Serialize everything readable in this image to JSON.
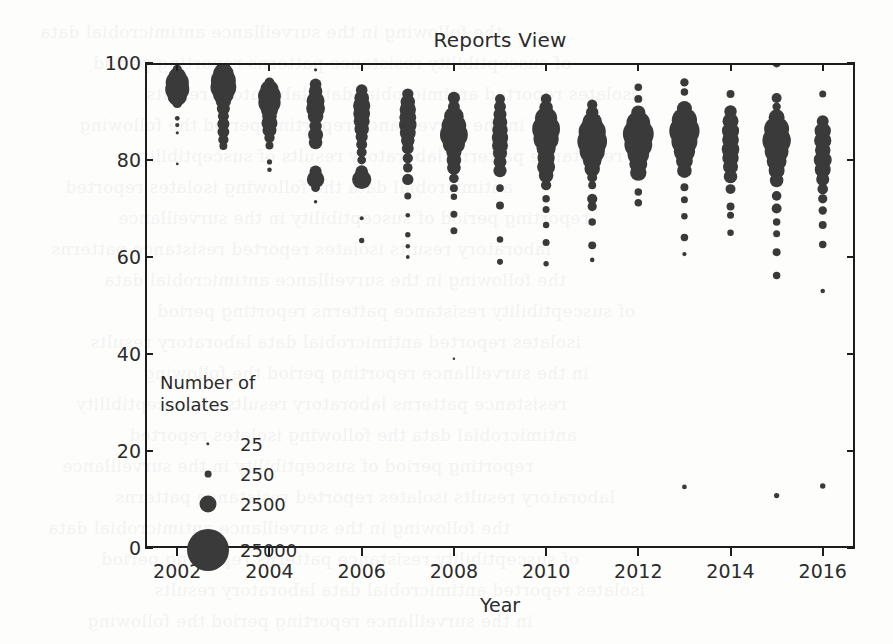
{
  "chart_data": {
    "type": "scatter",
    "title": "Reports View",
    "xlabel": "Year",
    "ylabel": "Susceptibility Percent",
    "xlim": [
      2001.3,
      2016.7
    ],
    "ylim": [
      0,
      100
    ],
    "xticks": [
      2002,
      2004,
      2006,
      2008,
      2010,
      2012,
      2014,
      2016
    ],
    "yticks": [
      0,
      20,
      40,
      60,
      80,
      100
    ],
    "grid": false,
    "size_encoding": "marker area proportional to number of isolates",
    "legend": {
      "title": "Number of\nisolates",
      "position": "lower-left inside axes",
      "entries": [
        {
          "label": "25",
          "value": 25,
          "radius_px": 1.7
        },
        {
          "label": "250",
          "value": 250,
          "radius_px": 3.4
        },
        {
          "label": "2500",
          "value": 2500,
          "radius_px": 8.5
        },
        {
          "label": "25000",
          "value": 25000,
          "radius_px": 21.0
        }
      ]
    },
    "points": [
      {
        "x": 2002,
        "y": 98.7,
        "n": 1200
      },
      {
        "x": 2002,
        "y": 97.3,
        "n": 4200
      },
      {
        "x": 2002,
        "y": 96.0,
        "n": 7600
      },
      {
        "x": 2002,
        "y": 94.6,
        "n": 8200
      },
      {
        "x": 2002,
        "y": 93.2,
        "n": 5400
      },
      {
        "x": 2002,
        "y": 91.8,
        "n": 1500
      },
      {
        "x": 2002,
        "y": 88.6,
        "n": 320
      },
      {
        "x": 2002,
        "y": 87.2,
        "n": 260
      },
      {
        "x": 2002,
        "y": 85.6,
        "n": 140
      },
      {
        "x": 2002,
        "y": 79.2,
        "n": 110
      },
      {
        "x": 2003,
        "y": 99.2,
        "n": 2600
      },
      {
        "x": 2003,
        "y": 97.8,
        "n": 6000
      },
      {
        "x": 2003,
        "y": 96.4,
        "n": 8800
      },
      {
        "x": 2003,
        "y": 95.0,
        "n": 9400
      },
      {
        "x": 2003,
        "y": 93.6,
        "n": 6200
      },
      {
        "x": 2003,
        "y": 92.2,
        "n": 3400
      },
      {
        "x": 2003,
        "y": 90.6,
        "n": 2400
      },
      {
        "x": 2003,
        "y": 89.0,
        "n": 1700
      },
      {
        "x": 2003,
        "y": 87.4,
        "n": 2100
      },
      {
        "x": 2003,
        "y": 85.8,
        "n": 2000
      },
      {
        "x": 2003,
        "y": 84.2,
        "n": 1500
      },
      {
        "x": 2003,
        "y": 82.9,
        "n": 900
      },
      {
        "x": 2004,
        "y": 96.0,
        "n": 1400
      },
      {
        "x": 2004,
        "y": 94.6,
        "n": 4600
      },
      {
        "x": 2004,
        "y": 93.2,
        "n": 7400
      },
      {
        "x": 2004,
        "y": 91.8,
        "n": 7000
      },
      {
        "x": 2004,
        "y": 90.4,
        "n": 4200
      },
      {
        "x": 2004,
        "y": 89.0,
        "n": 3000
      },
      {
        "x": 2004,
        "y": 87.6,
        "n": 3600
      },
      {
        "x": 2004,
        "y": 86.2,
        "n": 2800
      },
      {
        "x": 2004,
        "y": 84.6,
        "n": 1500
      },
      {
        "x": 2004,
        "y": 83.0,
        "n": 900
      },
      {
        "x": 2004,
        "y": 79.6,
        "n": 380
      },
      {
        "x": 2004,
        "y": 78.0,
        "n": 300
      },
      {
        "x": 2005,
        "y": 98.6,
        "n": 150
      },
      {
        "x": 2005,
        "y": 95.6,
        "n": 1900
      },
      {
        "x": 2005,
        "y": 94.2,
        "n": 2600
      },
      {
        "x": 2005,
        "y": 92.2,
        "n": 4600
      },
      {
        "x": 2005,
        "y": 90.6,
        "n": 5000
      },
      {
        "x": 2005,
        "y": 89.0,
        "n": 3400
      },
      {
        "x": 2005,
        "y": 87.0,
        "n": 2200
      },
      {
        "x": 2005,
        "y": 85.2,
        "n": 3200
      },
      {
        "x": 2005,
        "y": 83.6,
        "n": 2600
      },
      {
        "x": 2005,
        "y": 77.6,
        "n": 2100
      },
      {
        "x": 2005,
        "y": 76.0,
        "n": 4300
      },
      {
        "x": 2005,
        "y": 74.3,
        "n": 1100
      },
      {
        "x": 2005,
        "y": 71.4,
        "n": 180
      },
      {
        "x": 2006,
        "y": 94.4,
        "n": 1900
      },
      {
        "x": 2006,
        "y": 92.8,
        "n": 3100
      },
      {
        "x": 2006,
        "y": 91.2,
        "n": 4200
      },
      {
        "x": 2006,
        "y": 89.6,
        "n": 4000
      },
      {
        "x": 2006,
        "y": 88.0,
        "n": 3600
      },
      {
        "x": 2006,
        "y": 86.4,
        "n": 3000
      },
      {
        "x": 2006,
        "y": 84.8,
        "n": 2100
      },
      {
        "x": 2006,
        "y": 83.2,
        "n": 1700
      },
      {
        "x": 2006,
        "y": 81.6,
        "n": 1400
      },
      {
        "x": 2006,
        "y": 80.0,
        "n": 1100
      },
      {
        "x": 2006,
        "y": 77.6,
        "n": 2300
      },
      {
        "x": 2006,
        "y": 76.0,
        "n": 5200
      },
      {
        "x": 2006,
        "y": 68.0,
        "n": 230
      },
      {
        "x": 2006,
        "y": 63.4,
        "n": 400
      },
      {
        "x": 2007,
        "y": 93.6,
        "n": 1800
      },
      {
        "x": 2007,
        "y": 92.0,
        "n": 3000
      },
      {
        "x": 2007,
        "y": 90.4,
        "n": 3800
      },
      {
        "x": 2007,
        "y": 88.8,
        "n": 4000
      },
      {
        "x": 2007,
        "y": 87.2,
        "n": 4400
      },
      {
        "x": 2007,
        "y": 85.6,
        "n": 3600
      },
      {
        "x": 2007,
        "y": 84.0,
        "n": 2600
      },
      {
        "x": 2007,
        "y": 82.4,
        "n": 2000
      },
      {
        "x": 2007,
        "y": 80.4,
        "n": 1500
      },
      {
        "x": 2007,
        "y": 78.4,
        "n": 1300
      },
      {
        "x": 2007,
        "y": 76.0,
        "n": 1800
      },
      {
        "x": 2007,
        "y": 72.6,
        "n": 700
      },
      {
        "x": 2007,
        "y": 68.6,
        "n": 300
      },
      {
        "x": 2007,
        "y": 64.6,
        "n": 420
      },
      {
        "x": 2007,
        "y": 62.2,
        "n": 280
      },
      {
        "x": 2007,
        "y": 60.0,
        "n": 200
      },
      {
        "x": 2008,
        "y": 92.8,
        "n": 2100
      },
      {
        "x": 2008,
        "y": 91.0,
        "n": 2000
      },
      {
        "x": 2008,
        "y": 89.0,
        "n": 5400
      },
      {
        "x": 2008,
        "y": 87.0,
        "n": 8600
      },
      {
        "x": 2008,
        "y": 85.2,
        "n": 11000
      },
      {
        "x": 2008,
        "y": 83.4,
        "n": 7000
      },
      {
        "x": 2008,
        "y": 81.6,
        "n": 3200
      },
      {
        "x": 2008,
        "y": 80.0,
        "n": 3000
      },
      {
        "x": 2008,
        "y": 78.4,
        "n": 2700
      },
      {
        "x": 2008,
        "y": 76.2,
        "n": 1300
      },
      {
        "x": 2008,
        "y": 74.2,
        "n": 900
      },
      {
        "x": 2008,
        "y": 72.4,
        "n": 600
      },
      {
        "x": 2008,
        "y": 68.8,
        "n": 700
      },
      {
        "x": 2008,
        "y": 65.4,
        "n": 700
      },
      {
        "x": 2008,
        "y": 39.0,
        "n": 90
      },
      {
        "x": 2009,
        "y": 92.6,
        "n": 1400
      },
      {
        "x": 2009,
        "y": 91.0,
        "n": 2000
      },
      {
        "x": 2009,
        "y": 89.4,
        "n": 2400
      },
      {
        "x": 2009,
        "y": 87.8,
        "n": 3000
      },
      {
        "x": 2009,
        "y": 86.2,
        "n": 3400
      },
      {
        "x": 2009,
        "y": 84.6,
        "n": 3800
      },
      {
        "x": 2009,
        "y": 83.0,
        "n": 3600
      },
      {
        "x": 2009,
        "y": 81.4,
        "n": 2800
      },
      {
        "x": 2009,
        "y": 79.6,
        "n": 2400
      },
      {
        "x": 2009,
        "y": 77.8,
        "n": 2500
      },
      {
        "x": 2009,
        "y": 74.2,
        "n": 800
      },
      {
        "x": 2009,
        "y": 70.6,
        "n": 900
      },
      {
        "x": 2009,
        "y": 63.6,
        "n": 600
      },
      {
        "x": 2009,
        "y": 59.0,
        "n": 520
      },
      {
        "x": 2010,
        "y": 92.6,
        "n": 1600
      },
      {
        "x": 2010,
        "y": 90.8,
        "n": 2600
      },
      {
        "x": 2010,
        "y": 88.6,
        "n": 7000
      },
      {
        "x": 2010,
        "y": 86.4,
        "n": 11000
      },
      {
        "x": 2010,
        "y": 84.4,
        "n": 9000
      },
      {
        "x": 2010,
        "y": 82.4,
        "n": 5200
      },
      {
        "x": 2010,
        "y": 80.4,
        "n": 4200
      },
      {
        "x": 2010,
        "y": 78.6,
        "n": 4600
      },
      {
        "x": 2010,
        "y": 76.8,
        "n": 3000
      },
      {
        "x": 2010,
        "y": 74.8,
        "n": 1500
      },
      {
        "x": 2010,
        "y": 72.0,
        "n": 800
      },
      {
        "x": 2010,
        "y": 69.8,
        "n": 700
      },
      {
        "x": 2010,
        "y": 66.6,
        "n": 600
      },
      {
        "x": 2010,
        "y": 63.0,
        "n": 700
      },
      {
        "x": 2010,
        "y": 58.6,
        "n": 420
      },
      {
        "x": 2011,
        "y": 91.4,
        "n": 1500
      },
      {
        "x": 2011,
        "y": 89.8,
        "n": 2200
      },
      {
        "x": 2011,
        "y": 87.8,
        "n": 5600
      },
      {
        "x": 2011,
        "y": 85.8,
        "n": 10500
      },
      {
        "x": 2011,
        "y": 83.8,
        "n": 12500
      },
      {
        "x": 2011,
        "y": 81.8,
        "n": 9000
      },
      {
        "x": 2011,
        "y": 80.0,
        "n": 5000
      },
      {
        "x": 2011,
        "y": 78.2,
        "n": 3400
      },
      {
        "x": 2011,
        "y": 76.4,
        "n": 1400
      },
      {
        "x": 2011,
        "y": 74.8,
        "n": 900
      },
      {
        "x": 2011,
        "y": 72.0,
        "n": 1500
      },
      {
        "x": 2011,
        "y": 70.4,
        "n": 1200
      },
      {
        "x": 2011,
        "y": 67.2,
        "n": 800
      },
      {
        "x": 2011,
        "y": 62.4,
        "n": 900
      },
      {
        "x": 2011,
        "y": 59.4,
        "n": 300
      },
      {
        "x": 2012,
        "y": 95.0,
        "n": 800
      },
      {
        "x": 2012,
        "y": 92.6,
        "n": 900
      },
      {
        "x": 2012,
        "y": 89.8,
        "n": 2800
      },
      {
        "x": 2012,
        "y": 87.6,
        "n": 8000
      },
      {
        "x": 2012,
        "y": 85.4,
        "n": 13500
      },
      {
        "x": 2012,
        "y": 83.2,
        "n": 11000
      },
      {
        "x": 2012,
        "y": 81.2,
        "n": 6600
      },
      {
        "x": 2012,
        "y": 79.2,
        "n": 4600
      },
      {
        "x": 2012,
        "y": 77.4,
        "n": 3800
      },
      {
        "x": 2012,
        "y": 73.4,
        "n": 800
      },
      {
        "x": 2012,
        "y": 71.2,
        "n": 800
      },
      {
        "x": 2013,
        "y": 96.0,
        "n": 1000
      },
      {
        "x": 2013,
        "y": 94.0,
        "n": 800
      },
      {
        "x": 2013,
        "y": 90.6,
        "n": 3200
      },
      {
        "x": 2013,
        "y": 88.2,
        "n": 9000
      },
      {
        "x": 2013,
        "y": 86.0,
        "n": 13000
      },
      {
        "x": 2013,
        "y": 83.8,
        "n": 9600
      },
      {
        "x": 2013,
        "y": 81.8,
        "n": 6400
      },
      {
        "x": 2013,
        "y": 79.8,
        "n": 4000
      },
      {
        "x": 2013,
        "y": 77.8,
        "n": 3000
      },
      {
        "x": 2013,
        "y": 74.4,
        "n": 900
      },
      {
        "x": 2013,
        "y": 71.8,
        "n": 700
      },
      {
        "x": 2013,
        "y": 68.4,
        "n": 600
      },
      {
        "x": 2013,
        "y": 64.0,
        "n": 800
      },
      {
        "x": 2013,
        "y": 60.6,
        "n": 260
      },
      {
        "x": 2013,
        "y": 12.6,
        "n": 330
      },
      {
        "x": 2014,
        "y": 93.6,
        "n": 900
      },
      {
        "x": 2014,
        "y": 90.0,
        "n": 2200
      },
      {
        "x": 2014,
        "y": 88.0,
        "n": 3600
      },
      {
        "x": 2014,
        "y": 86.0,
        "n": 4200
      },
      {
        "x": 2014,
        "y": 84.2,
        "n": 4000
      },
      {
        "x": 2014,
        "y": 82.2,
        "n": 4400
      },
      {
        "x": 2014,
        "y": 80.4,
        "n": 3800
      },
      {
        "x": 2014,
        "y": 78.6,
        "n": 3200
      },
      {
        "x": 2014,
        "y": 76.6,
        "n": 2600
      },
      {
        "x": 2014,
        "y": 74.0,
        "n": 1400
      },
      {
        "x": 2014,
        "y": 70.4,
        "n": 900
      },
      {
        "x": 2014,
        "y": 68.6,
        "n": 700
      },
      {
        "x": 2014,
        "y": 65.0,
        "n": 600
      },
      {
        "x": 2015,
        "y": 100.0,
        "n": 1100
      },
      {
        "x": 2015,
        "y": 92.8,
        "n": 1400
      },
      {
        "x": 2015,
        "y": 91.0,
        "n": 1000
      },
      {
        "x": 2015,
        "y": 88.8,
        "n": 3600
      },
      {
        "x": 2015,
        "y": 86.4,
        "n": 8800
      },
      {
        "x": 2015,
        "y": 84.0,
        "n": 11500
      },
      {
        "x": 2015,
        "y": 81.8,
        "n": 8000
      },
      {
        "x": 2015,
        "y": 79.8,
        "n": 5600
      },
      {
        "x": 2015,
        "y": 77.8,
        "n": 3600
      },
      {
        "x": 2015,
        "y": 75.8,
        "n": 2600
      },
      {
        "x": 2015,
        "y": 72.6,
        "n": 1300
      },
      {
        "x": 2015,
        "y": 70.0,
        "n": 1400
      },
      {
        "x": 2015,
        "y": 67.2,
        "n": 800
      },
      {
        "x": 2015,
        "y": 64.8,
        "n": 700
      },
      {
        "x": 2015,
        "y": 61.0,
        "n": 900
      },
      {
        "x": 2015,
        "y": 56.2,
        "n": 800
      },
      {
        "x": 2015,
        "y": 10.8,
        "n": 400
      },
      {
        "x": 2016,
        "y": 93.6,
        "n": 700
      },
      {
        "x": 2016,
        "y": 88.0,
        "n": 2000
      },
      {
        "x": 2016,
        "y": 86.0,
        "n": 3800
      },
      {
        "x": 2016,
        "y": 84.0,
        "n": 4200
      },
      {
        "x": 2016,
        "y": 82.0,
        "n": 3400
      },
      {
        "x": 2016,
        "y": 80.0,
        "n": 4600
      },
      {
        "x": 2016,
        "y": 78.0,
        "n": 3600
      },
      {
        "x": 2016,
        "y": 76.0,
        "n": 2400
      },
      {
        "x": 2016,
        "y": 74.0,
        "n": 1600
      },
      {
        "x": 2016,
        "y": 72.0,
        "n": 1200
      },
      {
        "x": 2016,
        "y": 69.6,
        "n": 1000
      },
      {
        "x": 2016,
        "y": 66.6,
        "n": 900
      },
      {
        "x": 2016,
        "y": 62.6,
        "n": 800
      },
      {
        "x": 2016,
        "y": 53.0,
        "n": 300
      },
      {
        "x": 2016,
        "y": 12.8,
        "n": 420
      }
    ]
  },
  "style": {
    "marker_color": "#3a3a3a",
    "axis_color": "#1d1d1d",
    "text_color": "#2b2b2b",
    "background": "#fdfdfc"
  },
  "bleed_text": [
    "the following",
    "of susceptibility",
    "isolates reported",
    "in the surveillance",
    "resistance patterns",
    "antimicrobial data",
    "reporting period",
    "laboratory results"
  ]
}
